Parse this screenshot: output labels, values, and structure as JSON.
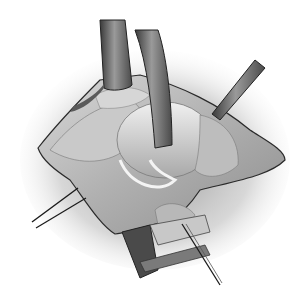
{
  "image": {
    "kind": "grayscale surgical illustration",
    "subject": "open surgical field with retractors and sutures",
    "width": 303,
    "height": 304,
    "elements": {
      "retractors": 4,
      "suture_needles": 2,
      "incision_drape": 1
    },
    "colors": {
      "background": "#ffffff",
      "shadow": "#9a9a9a",
      "tissue_light": "#e6e6e6",
      "tissue_mid": "#bdbdbd",
      "tissue_dark": "#7a7a7a",
      "retractor_light": "#8c8c8c",
      "retractor_dark": "#3a3a3a",
      "outline": "#2a2a2a"
    }
  }
}
